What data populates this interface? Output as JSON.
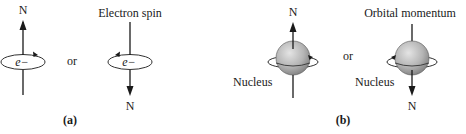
{
  "panel_a": {
    "caption": "(a)",
    "left": {
      "pole_label": "N",
      "particle_label": "e−"
    },
    "separator": "or",
    "right": {
      "title": "Electron spin",
      "pole_label": "N",
      "particle_label": "e−"
    }
  },
  "panel_b": {
    "caption": "(b)",
    "left": {
      "pole_label": "N",
      "nucleus_label": "Nucleus"
    },
    "separator": "or",
    "right": {
      "title": "Orbital momentum",
      "pole_label": "N",
      "nucleus_label": "Nucleus"
    }
  },
  "colors": {
    "line": "#1a1a1a",
    "sphere_light": "#d8d8d8",
    "sphere_dark": "#8a8a8a"
  }
}
